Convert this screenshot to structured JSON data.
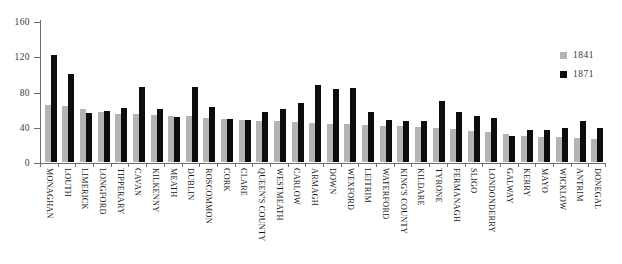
{
  "chart_data": {
    "type": "bar",
    "title": "",
    "subtitle": "",
    "xlabel": "",
    "ylabel": "",
    "ylim": [
      0,
      160
    ],
    "yticks": [
      0,
      40,
      80,
      120,
      160
    ],
    "ytick_labels": [
      "0",
      "40",
      "80",
      "120",
      "160"
    ],
    "grid": false,
    "legend_position": "right",
    "categories": [
      "MONAGHAN",
      "LOUTH",
      "LIMERICK",
      "LONGFORD",
      "TIPPERARY",
      "CAVAN",
      "KILKENNY",
      "MEATH",
      "DUBLIN",
      "ROSCOMMON",
      "CORK",
      "CLARE",
      "QUEEN'S COUNTY",
      "WESTMEATH",
      "CARLOW",
      "ARMAGH",
      "DOWN",
      "WEXFORD",
      "LEITRIM",
      "WATERFORD",
      "KING'S COUNTY",
      "KILDARE",
      "TYRONE",
      "FERMANAGH",
      "SLIGO",
      "LONDONDERRY",
      "GALWAY",
      "KERRY",
      "MAYO",
      "WICKLOW",
      "ANTRIM",
      "DONEGAL"
    ],
    "series": [
      {
        "name": "1841",
        "color": "#b4b4b4",
        "values": [
          65,
          64,
          60,
          57,
          55,
          54,
          53,
          52,
          52,
          50,
          49,
          48,
          47,
          46,
          45,
          44,
          43,
          43,
          42,
          41,
          41,
          40,
          39,
          38,
          35,
          34,
          32,
          29,
          28,
          28,
          27,
          26
        ]
      },
      {
        "name": "1871",
        "color": "#0d0d0d",
        "values": [
          121,
          100,
          56,
          58,
          61,
          85,
          60,
          51,
          85,
          62,
          49,
          48,
          57,
          60,
          67,
          87,
          83,
          84,
          57,
          48,
          47,
          47,
          69,
          57,
          52,
          50,
          30,
          36,
          36,
          39,
          46,
          39
        ]
      }
    ]
  },
  "legend": {
    "items": [
      {
        "label": "1841",
        "color": "#b4b4b4"
      },
      {
        "label": "1871",
        "color": "#0d0d0d"
      }
    ]
  },
  "axes": {
    "y_tick_labels": [
      "160",
      "120",
      "80",
      "40",
      "0"
    ]
  }
}
